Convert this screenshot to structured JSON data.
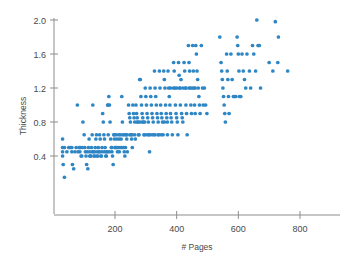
{
  "chart_data": {
    "type": "scatter",
    "title": "",
    "xlabel": "# Pages",
    "ylabel": "Thickness",
    "xlim": [
      0,
      930
    ],
    "ylim": [
      0.1,
      2.08
    ],
    "xticks": [
      200,
      400,
      600,
      800
    ],
    "xtick_labels": [
      "200",
      "400",
      "600",
      "800"
    ],
    "yticks": [
      0.4,
      0.8,
      1.2,
      1.6,
      2.0
    ],
    "ytick_labels": [
      "0.4",
      "0.8",
      "1.2",
      "1.6",
      "2.0"
    ],
    "grid": false,
    "legend": null,
    "marker": "circle",
    "marker_color": "#2f86c5",
    "marker_size": 3,
    "axis_color": "#8d8d8d",
    "text_color": "#4a4a4a",
    "background": "#ffffff",
    "n_points": 288,
    "points": [
      [
        30,
        0.6
      ],
      [
        30,
        0.5
      ],
      [
        30,
        0.45
      ],
      [
        30,
        0.4
      ],
      [
        32,
        0.3
      ],
      [
        36,
        0.15
      ],
      [
        50,
        0.5
      ],
      [
        55,
        0.5
      ],
      [
        60,
        0.5
      ],
      [
        60,
        0.45
      ],
      [
        62,
        0.3
      ],
      [
        66,
        0.25
      ],
      [
        78,
        1.0
      ],
      [
        80,
        0.45
      ],
      [
        84,
        0.5
      ],
      [
        88,
        0.5
      ],
      [
        90,
        0.4
      ],
      [
        92,
        0.4
      ],
      [
        96,
        0.8
      ],
      [
        100,
        0.65
      ],
      [
        102,
        0.5
      ],
      [
        104,
        0.45
      ],
      [
        106,
        0.4
      ],
      [
        108,
        0.3
      ],
      [
        112,
        0.25
      ],
      [
        114,
        0.5
      ],
      [
        116,
        0.6
      ],
      [
        118,
        0.4
      ],
      [
        120,
        0.4
      ],
      [
        122,
        0.4
      ],
      [
        124,
        0.5
      ],
      [
        126,
        0.65
      ],
      [
        128,
        1.0
      ],
      [
        130,
        0.45
      ],
      [
        132,
        0.4
      ],
      [
        134,
        0.4
      ],
      [
        136,
        0.5
      ],
      [
        138,
        0.6
      ],
      [
        140,
        0.65
      ],
      [
        142,
        0.4
      ],
      [
        144,
        0.4
      ],
      [
        146,
        0.5
      ],
      [
        148,
        0.45
      ],
      [
        150,
        0.65
      ],
      [
        152,
        0.6
      ],
      [
        154,
        0.4
      ],
      [
        156,
        0.4
      ],
      [
        158,
        0.5
      ],
      [
        160,
        0.9
      ],
      [
        162,
        0.8
      ],
      [
        164,
        0.65
      ],
      [
        166,
        0.6
      ],
      [
        168,
        0.5
      ],
      [
        170,
        0.4
      ],
      [
        172,
        0.4
      ],
      [
        174,
        0.45
      ],
      [
        176,
        1.0
      ],
      [
        178,
        1.0
      ],
      [
        178,
        0.65
      ],
      [
        180,
        1.1
      ],
      [
        182,
        1.0
      ],
      [
        184,
        0.8
      ],
      [
        186,
        0.6
      ],
      [
        188,
        0.5
      ],
      [
        190,
        0.45
      ],
      [
        192,
        0.4
      ],
      [
        194,
        0.3
      ],
      [
        196,
        0.65
      ],
      [
        198,
        0.6
      ],
      [
        200,
        0.5
      ],
      [
        202,
        0.5
      ],
      [
        204,
        0.65
      ],
      [
        206,
        0.6
      ],
      [
        208,
        0.45
      ],
      [
        210,
        0.5
      ],
      [
        212,
        0.65
      ],
      [
        214,
        0.6
      ],
      [
        216,
        0.5
      ],
      [
        218,
        0.65
      ],
      [
        220,
        0.6
      ],
      [
        222,
        1.1
      ],
      [
        224,
        0.8
      ],
      [
        226,
        0.65
      ],
      [
        228,
        0.5
      ],
      [
        230,
        0.45
      ],
      [
        232,
        0.4
      ],
      [
        234,
        0.5
      ],
      [
        236,
        0.65
      ],
      [
        238,
        0.6
      ],
      [
        240,
        0.45
      ],
      [
        244,
        1.0
      ],
      [
        246,
        0.9
      ],
      [
        248,
        0.85
      ],
      [
        250,
        0.8
      ],
      [
        252,
        0.65
      ],
      [
        254,
        0.6
      ],
      [
        256,
        0.5
      ],
      [
        258,
        1.0
      ],
      [
        260,
        0.9
      ],
      [
        262,
        0.85
      ],
      [
        264,
        0.65
      ],
      [
        266,
        0.6
      ],
      [
        268,
        1.0
      ],
      [
        270,
        0.9
      ],
      [
        272,
        0.85
      ],
      [
        274,
        0.8
      ],
      [
        276,
        0.65
      ],
      [
        278,
        0.65
      ],
      [
        280,
        1.3
      ],
      [
        282,
        1.3
      ],
      [
        284,
        1.1
      ],
      [
        286,
        1.0
      ],
      [
        288,
        0.9
      ],
      [
        290,
        0.85
      ],
      [
        292,
        0.8
      ],
      [
        294,
        0.65
      ],
      [
        296,
        0.65
      ],
      [
        298,
        1.2
      ],
      [
        300,
        1.1
      ],
      [
        302,
        1.0
      ],
      [
        304,
        0.9
      ],
      [
        306,
        0.85
      ],
      [
        308,
        0.8
      ],
      [
        310,
        0.65
      ],
      [
        312,
        0.45
      ],
      [
        314,
        1.2
      ],
      [
        316,
        1.1
      ],
      [
        318,
        1.0
      ],
      [
        320,
        0.9
      ],
      [
        322,
        0.85
      ],
      [
        324,
        0.8
      ],
      [
        326,
        0.65
      ],
      [
        328,
        1.4
      ],
      [
        330,
        1.2
      ],
      [
        332,
        1.1
      ],
      [
        334,
        1.0
      ],
      [
        336,
        0.9
      ],
      [
        338,
        0.85
      ],
      [
        340,
        0.8
      ],
      [
        342,
        0.65
      ],
      [
        344,
        1.4
      ],
      [
        346,
        1.2
      ],
      [
        348,
        1.0
      ],
      [
        350,
        0.9
      ],
      [
        352,
        0.85
      ],
      [
        354,
        0.8
      ],
      [
        356,
        0.65
      ],
      [
        358,
        1.4
      ],
      [
        360,
        1.3
      ],
      [
        362,
        1.2
      ],
      [
        364,
        1.0
      ],
      [
        366,
        0.9
      ],
      [
        368,
        0.85
      ],
      [
        370,
        0.65
      ],
      [
        372,
        1.4
      ],
      [
        374,
        1.2
      ],
      [
        376,
        1.1
      ],
      [
        378,
        1.0
      ],
      [
        380,
        0.9
      ],
      [
        382,
        0.85
      ],
      [
        384,
        0.8
      ],
      [
        386,
        0.65
      ],
      [
        390,
        1.5
      ],
      [
        392,
        1.4
      ],
      [
        394,
        1.2
      ],
      [
        396,
        1.0
      ],
      [
        398,
        0.9
      ],
      [
        400,
        0.85
      ],
      [
        402,
        0.8
      ],
      [
        404,
        0.65
      ],
      [
        406,
        1.5
      ],
      [
        408,
        1.35
      ],
      [
        410,
        1.2
      ],
      [
        412,
        1.0
      ],
      [
        414,
        1.3
      ],
      [
        416,
        0.9
      ],
      [
        418,
        0.85
      ],
      [
        420,
        0.8
      ],
      [
        424,
        1.5
      ],
      [
        426,
        1.4
      ],
      [
        428,
        1.2
      ],
      [
        430,
        1.0
      ],
      [
        432,
        0.9
      ],
      [
        434,
        0.65
      ],
      [
        438,
        1.7
      ],
      [
        440,
        1.5
      ],
      [
        442,
        1.4
      ],
      [
        444,
        1.2
      ],
      [
        446,
        1.0
      ],
      [
        448,
        0.9
      ],
      [
        452,
        1.7
      ],
      [
        454,
        1.4
      ],
      [
        456,
        1.2
      ],
      [
        458,
        1.0
      ],
      [
        460,
        0.9
      ],
      [
        462,
        1.7
      ],
      [
        464,
        1.6
      ],
      [
        466,
        1.4
      ],
      [
        468,
        1.3
      ],
      [
        470,
        1.2
      ],
      [
        472,
        1.1
      ],
      [
        474,
        1.0
      ],
      [
        476,
        0.9
      ],
      [
        480,
        1.7
      ],
      [
        484,
        1.2
      ],
      [
        486,
        1.0
      ],
      [
        490,
        1.2
      ],
      [
        494,
        1.0
      ],
      [
        498,
        0.9
      ],
      [
        540,
        1.8
      ],
      [
        544,
        1.5
      ],
      [
        546,
        1.4
      ],
      [
        548,
        1.3
      ],
      [
        550,
        1.2
      ],
      [
        552,
        1.1
      ],
      [
        554,
        1.0
      ],
      [
        556,
        0.9
      ],
      [
        558,
        0.8
      ],
      [
        562,
        1.6
      ],
      [
        564,
        1.4
      ],
      [
        566,
        1.3
      ],
      [
        568,
        1.1
      ],
      [
        570,
        0.9
      ],
      [
        576,
        1.6
      ],
      [
        580,
        1.3
      ],
      [
        584,
        1.1
      ],
      [
        588,
        1.1
      ],
      [
        592,
        1.1
      ],
      [
        596,
        1.8
      ],
      [
        598,
        1.7
      ],
      [
        600,
        1.6
      ],
      [
        602,
        1.4
      ],
      [
        604,
        1.1
      ],
      [
        608,
        1.1
      ],
      [
        612,
        1.6
      ],
      [
        616,
        1.4
      ],
      [
        620,
        1.3
      ],
      [
        624,
        1.2
      ],
      [
        628,
        1.6
      ],
      [
        636,
        1.4
      ],
      [
        640,
        1.2
      ],
      [
        646,
        1.7
      ],
      [
        650,
        1.6
      ],
      [
        656,
        1.4
      ],
      [
        660,
        2.0
      ],
      [
        664,
        1.7
      ],
      [
        668,
        1.7
      ],
      [
        672,
        1.2
      ],
      [
        700,
        1.5
      ],
      [
        712,
        1.4
      ],
      [
        720,
        1.98
      ],
      [
        728,
        1.5
      ],
      [
        730,
        1.8
      ],
      [
        760,
        1.4
      ],
      [
        36,
        0.5
      ],
      [
        44,
        0.45
      ],
      [
        70,
        0.45
      ],
      [
        74,
        0.5
      ],
      [
        86,
        0.45
      ],
      [
        94,
        0.5
      ],
      [
        110,
        0.45
      ],
      [
        118,
        0.45
      ],
      [
        126,
        0.45
      ],
      [
        134,
        0.45
      ],
      [
        142,
        0.45
      ],
      [
        150,
        0.45
      ],
      [
        158,
        0.45
      ],
      [
        166,
        0.45
      ],
      [
        174,
        0.45
      ],
      [
        182,
        0.45
      ],
      [
        190,
        0.5
      ],
      [
        198,
        0.65
      ],
      [
        206,
        0.5
      ],
      [
        214,
        0.45
      ],
      [
        222,
        0.5
      ],
      [
        230,
        0.65
      ],
      [
        238,
        0.65
      ],
      [
        248,
        0.65
      ],
      [
        256,
        0.65
      ],
      [
        264,
        0.8
      ],
      [
        272,
        0.8
      ],
      [
        280,
        0.8
      ],
      [
        288,
        0.8
      ],
      [
        296,
        0.8
      ],
      [
        304,
        0.65
      ],
      [
        312,
        0.65
      ],
      [
        320,
        0.65
      ],
      [
        330,
        0.65
      ],
      [
        340,
        0.65
      ],
      [
        350,
        0.65
      ],
      [
        360,
        0.8
      ],
      [
        370,
        0.8
      ],
      [
        380,
        1.2
      ],
      [
        390,
        1.2
      ],
      [
        400,
        1.2
      ],
      [
        410,
        1.2
      ],
      [
        420,
        1.2
      ],
      [
        430,
        1.2
      ],
      [
        440,
        1.2
      ],
      [
        450,
        1.2
      ],
      [
        460,
        1.2
      ]
    ]
  },
  "axes": {
    "y_axis_label": "Thickness",
    "x_axis_label": "# Pages"
  }
}
